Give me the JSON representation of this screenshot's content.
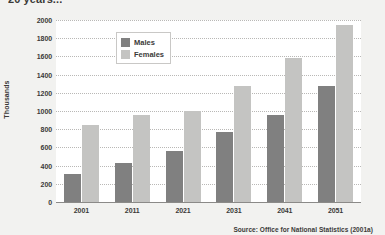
{
  "heading": "20 years...",
  "source_note": "Source: Office for National Statistics (2001a)",
  "legend": {
    "position": "top-left-inside",
    "entries": [
      {
        "label": "Males",
        "color": "#808080"
      },
      {
        "label": "Females",
        "color": "#c4c4c2"
      }
    ]
  },
  "colors": {
    "male": "#808080",
    "female": "#c4c4c2",
    "page_background": "#f2f2f0",
    "plot_background": "#ffffff",
    "gridline": "#b9b8b6",
    "axis": "#8b8a88",
    "text": "#3b3a38"
  },
  "chart_data": {
    "type": "bar",
    "title": "20 years...",
    "xlabel": "",
    "ylabel": "Thousands",
    "ylim": [
      0,
      2000
    ],
    "ytick_step": 200,
    "yticks": [
      0,
      200,
      400,
      600,
      800,
      1000,
      1200,
      1400,
      1600,
      1800,
      2000
    ],
    "ytick_labels": [
      "0",
      "200",
      "400",
      "600",
      "800",
      "1000",
      "1200",
      "1400",
      "1600",
      "1800",
      "2000"
    ],
    "grid": true,
    "grid_style": "dotted-horizontal",
    "legend": [
      "Males",
      "Females"
    ],
    "legend_position": "upper left",
    "categories": [
      "2001",
      "2011",
      "2021",
      "2031",
      "2041",
      "2051"
    ],
    "series": [
      {
        "name": "Males",
        "color": "#808080",
        "values": [
          310,
          430,
          560,
          770,
          960,
          1280
        ]
      },
      {
        "name": "Females",
        "color": "#c4c4c2",
        "values": [
          850,
          960,
          995,
          1270,
          1580,
          1950
        ]
      }
    ],
    "annotations": [
      "Source: Office for National Statistics (2001a)"
    ]
  }
}
